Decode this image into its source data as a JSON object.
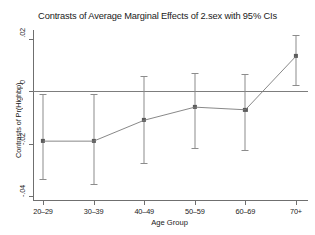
{
  "chart_data": {
    "type": "line",
    "title": "Contrasts of Average Marginal Effects of 2.sex with 95% CIs",
    "xlabel": "Age Group",
    "ylabel": "Contrasts of Pr(Highbp)",
    "categories": [
      "20–29",
      "30–39",
      "40–49",
      "50–59",
      "60–69",
      "70+"
    ],
    "values": [
      -0.019,
      -0.019,
      -0.011,
      -0.006,
      -0.007,
      0.0135
    ],
    "ci_low": [
      -0.0335,
      -0.0355,
      -0.0275,
      -0.0215,
      -0.0225,
      0.0025
    ],
    "ci_high": [
      -0.001,
      -0.001,
      0.006,
      0.007,
      0.0065,
      0.0215
    ],
    "ylim": [
      -0.0415,
      0.0235
    ],
    "ytick_values": [
      0.02,
      0,
      -0.02,
      -0.04
    ],
    "ytick_labels": [
      ".02",
      "0",
      "-.02",
      "-.04"
    ],
    "grid": false,
    "legend": "none",
    "zero_reference_line": 0,
    "marker": "filled-square",
    "series_color": "#7a7a7a",
    "axis_color": "#6f6f6f",
    "text_color": "#1a1a1a"
  }
}
